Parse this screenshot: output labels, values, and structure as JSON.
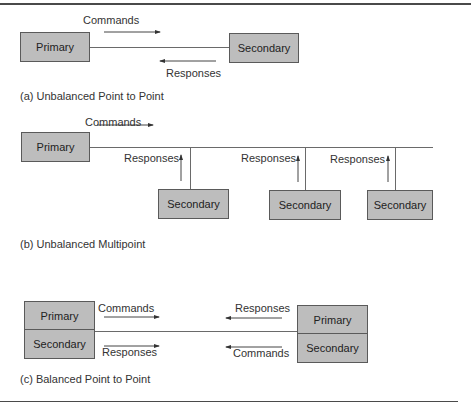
{
  "diagram": {
    "section_a": {
      "caption": "(a) Unbalanced Point to Point",
      "primary_label": "Primary",
      "secondary_label": "Secondary",
      "commands_label": "Commands",
      "responses_label": "Responses"
    },
    "section_b": {
      "caption": "(b) Unbalanced Multipoint",
      "primary_label": "Primary",
      "commands_label": "Commands",
      "secondaries": [
        {
          "label": "Secondary",
          "responses_label": "Responses"
        },
        {
          "label": "Secondary",
          "responses_label": "Responses"
        },
        {
          "label": "Secondary",
          "responses_label": "Responses"
        }
      ]
    },
    "section_c": {
      "caption": "(c) Balanced Point to Point",
      "left_station": {
        "top_label": "Primary",
        "bottom_label": "Secondary"
      },
      "right_station": {
        "top_label": "Primary",
        "bottom_label": "Secondary"
      },
      "left_top_arrow_label": "Commands",
      "left_bottom_arrow_label": "Responses",
      "right_top_arrow_label": "Responses",
      "right_bottom_arrow_label": "Commands"
    },
    "colors": {
      "box_fill": "#bdbdbd",
      "box_border": "#5a5a5a",
      "line": "#6a6a6a",
      "rule": "#4a4a4a"
    }
  }
}
